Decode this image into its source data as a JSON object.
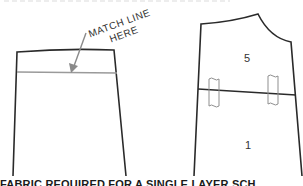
{
  "figure": {
    "annotation": {
      "line1": "MATCH LINE",
      "line2": "HERE"
    },
    "left_piece": {
      "description": "Pattern piece with match line"
    },
    "right_piece": {
      "upper_label": "5",
      "lower_label": "1"
    },
    "caption": "FABRIC REQUIRED FOR A SINGLE LAYER SCH"
  },
  "colors": {
    "outline": "#2a2a2a",
    "match_line": "#9a9a9a",
    "arrow": "#8a8a8a",
    "tape": "#8f8f8f",
    "text": "#333333"
  }
}
